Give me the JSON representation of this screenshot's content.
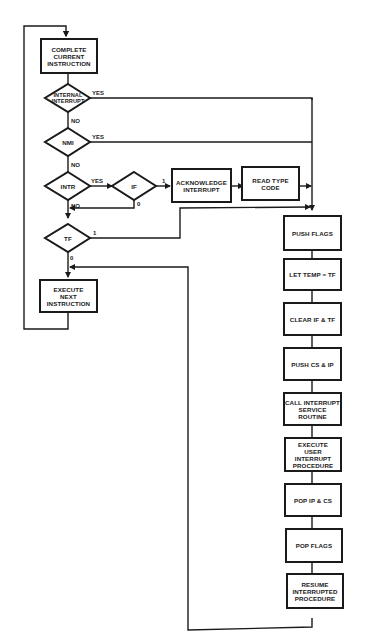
{
  "diagram": {
    "type": "flowchart",
    "nodes": {
      "complete": {
        "label": "COMPLETE\nCURRENT\nINSTRUCTION"
      },
      "internal": {
        "label": "INTERNAL\nINTERRUPT"
      },
      "nmi": {
        "label": "NMI"
      },
      "intr": {
        "label": "INTR"
      },
      "if": {
        "label": "IF"
      },
      "ack": {
        "label": "ACKNOWLEDGE\nINTERRUPT"
      },
      "readtype": {
        "label": "READ TYPE\nCODE"
      },
      "tf": {
        "label": "TF"
      },
      "execnext": {
        "label": "EXECUTE\nNEXT\nINSTRUCTION"
      },
      "pushflags": {
        "label": "PUSH FLAGS"
      },
      "lettemp": {
        "label": "LET TEMP = TF"
      },
      "clear": {
        "label": "CLEAR IF & TF"
      },
      "pushcs": {
        "label": "PUSH CS & IP"
      },
      "call": {
        "label": "CALL INTERRUPT\nSERVICE ROUTINE"
      },
      "execuser": {
        "label": "EXECUTE\nUSER INTERRUPT\nPROCEDURE"
      },
      "popip": {
        "label": "POP IP & CS"
      },
      "popflags": {
        "label": "POP FLAGS"
      },
      "resume": {
        "label": "RESUME\nINTERRUPTED\nPROCEDURE"
      }
    },
    "edge_labels": {
      "internal_yes": "YES",
      "internal_no": "NO",
      "nmi_yes": "YES",
      "nmi_no": "NO",
      "intr_yes": "YES",
      "intr_no": "NO",
      "if_1": "1",
      "if_0": "0",
      "tf_1": "1",
      "tf_0": "0"
    }
  }
}
